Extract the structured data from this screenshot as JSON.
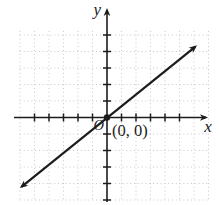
{
  "figure": {
    "background": "#ffffff",
    "ink_color": "#1c1c1c",
    "grid_color": "#c9c9c9"
  },
  "chart_data": {
    "type": "line",
    "title": "",
    "xlabel": "x",
    "ylabel": "y",
    "origin_label": "O",
    "grid": "dotted square grid, light gray",
    "legend": "none",
    "tick_labels": "none (unlabeled unit ticks on both axes)",
    "axis_style": "x-axis arrow right end only, y-axis arrow top end only",
    "x_gridline_cells": [
      -6,
      -5,
      -4,
      -3,
      -2,
      -1,
      1,
      2,
      3,
      4,
      5,
      6,
      7
    ],
    "y_gridline_cells": [
      -5,
      -4,
      -3,
      -2,
      -1,
      1,
      2,
      3,
      4,
      5
    ],
    "x_tick_cells": [
      -5,
      -4,
      -3,
      -2,
      -1,
      1,
      2,
      3,
      4,
      5
    ],
    "y_tick_cells": [
      -5,
      -4,
      -3,
      -2,
      -1,
      1,
      2,
      3,
      4,
      5
    ],
    "xlim_cells": [
      -6.4,
      7.3
    ],
    "ylim_cells": [
      -5.3,
      6.6
    ],
    "series": [
      {
        "name": "line through origin",
        "style": "solid black, arrowheads on both ends",
        "passes_through": [
          0,
          0
        ],
        "slope_cells_estimate": 0.7,
        "endpoints_cells": [
          [
            -5.9,
            -4.2
          ],
          [
            6.1,
            4.3
          ]
        ],
        "marked_points": [
          {
            "x": 0,
            "y": 0,
            "label": "(0, 0)",
            "marker": "filled dot"
          }
        ]
      }
    ]
  }
}
